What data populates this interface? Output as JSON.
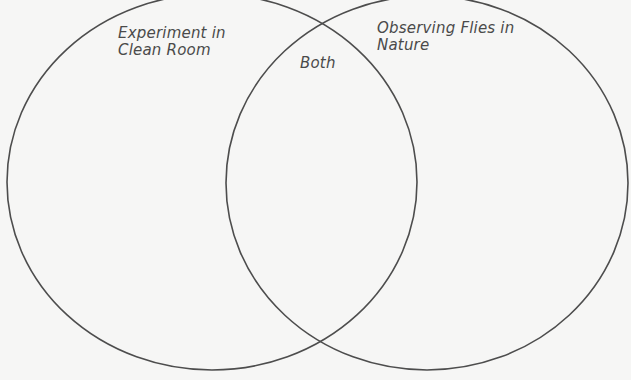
{
  "diagram": {
    "type": "venn",
    "circles": [
      {
        "id": "left",
        "label": "Experiment in\nClean Room",
        "cx": 212,
        "cy": 182,
        "rx": 205,
        "ry": 188
      },
      {
        "id": "right",
        "label": "Observing Flies in\nNature",
        "cx": 427,
        "cy": 183,
        "rx": 201,
        "ry": 187
      }
    ],
    "overlap_label": "Both",
    "colors": {
      "background": "#f6f6f5",
      "stroke": "#4d4d4d",
      "text": "#4a4a4a"
    }
  }
}
